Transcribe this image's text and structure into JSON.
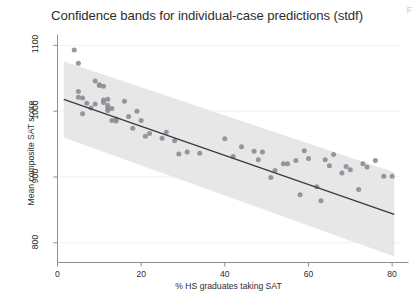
{
  "figure": {
    "title": "Confidence bands for individual-case predictions (stdf)",
    "corner_mark": "F"
  },
  "chart_data": {
    "type": "scatter",
    "title": "Confidence bands for individual-case predictions (stdf)",
    "xlabel": "% HS graduates taking SAT",
    "ylabel": "Mean composite SAT score",
    "xlim": [
      0,
      82
    ],
    "ylim": [
      770,
      1115
    ],
    "xticks": [
      0,
      20,
      40,
      60,
      80
    ],
    "xtick_labels": [
      "0",
      "20",
      "40",
      "60",
      "80"
    ],
    "yticks": [
      800,
      900,
      1000,
      1100
    ],
    "ytick_labels": [
      "800",
      "900",
      "1000",
      "1100"
    ],
    "grid": "horizontal-faint",
    "legend": "none",
    "marker_color": "#8a8d96",
    "band_color": "#e7e7e7",
    "line_color": "#3a3a3a",
    "axis_color": "#8e8e8e",
    "series": [
      {
        "name": "States",
        "x": [
          4,
          5,
          5,
          5,
          6,
          6,
          7,
          8,
          9,
          9,
          10,
          10,
          11,
          11,
          11,
          12,
          12,
          12,
          12,
          13,
          13,
          14,
          14,
          16,
          17,
          18,
          19,
          20,
          21,
          22,
          25,
          26,
          28,
          29,
          31,
          34,
          40,
          42,
          44,
          47,
          48,
          49,
          51,
          52,
          54,
          55,
          57,
          58,
          59,
          60,
          62,
          63,
          64,
          65,
          66,
          68,
          69,
          70,
          72,
          73,
          74,
          76,
          78,
          80
        ],
        "y": [
          1093,
          1073,
          1030,
          1021,
          1020,
          996,
          1012,
          1005,
          1046,
          1011,
          1040,
          1039,
          1038,
          1017,
          1013,
          1018,
          1009,
          1005,
          1001,
          1004,
          986,
          988,
          985,
          1015,
          992,
          974,
          1000,
          986,
          962,
          966,
          959,
          968,
          955,
          935,
          938,
          936,
          958,
          931,
          946,
          939,
          926,
          938,
          899,
          910,
          920,
          920,
          925,
          873,
          940,
          928,
          885,
          864,
          926,
          917,
          934,
          906,
          916,
          911,
          881,
          920,
          915,
          925,
          901,
          901
        ]
      }
    ],
    "fit_line": {
      "name": "Linear fit",
      "x": [
        1.5,
        80.5
      ],
      "y": [
        1018,
        843
      ]
    },
    "confidence_band": {
      "name": "Individual-case prediction band (stdf)",
      "x": [
        1.5,
        80.5
      ],
      "upper": [
        1076,
        907
      ],
      "lower": [
        960,
        779
      ]
    }
  }
}
